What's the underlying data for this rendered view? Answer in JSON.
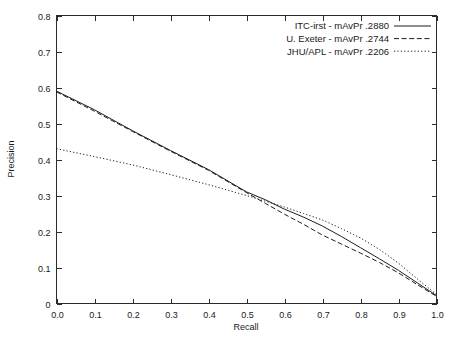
{
  "chart_data": {
    "type": "line",
    "title": "",
    "subtitle": "",
    "xlabel": "Recall",
    "ylabel": "Precision",
    "xlim": [
      0.0,
      1.0
    ],
    "ylim": [
      0.0,
      0.8
    ],
    "grid": false,
    "legend_position": "top-right",
    "x_ticks": [
      "0.0",
      "0.1",
      "0.2",
      "0.3",
      "0.4",
      "0.5",
      "0.6",
      "0.7",
      "0.8",
      "0.9",
      "1.0"
    ],
    "x_tick_values": [
      0.0,
      0.1,
      0.2,
      0.3,
      0.4,
      0.5,
      0.6,
      0.7,
      0.8,
      0.9,
      1.0
    ],
    "y_ticks": [
      "0",
      "0.1",
      "0.2",
      "0.3",
      "0.4",
      "0.5",
      "0.6",
      "0.7",
      "0.8"
    ],
    "y_tick_values": [
      0.0,
      0.1,
      0.2,
      0.3,
      0.4,
      0.5,
      0.6,
      0.7,
      0.8
    ],
    "x": [
      0.0,
      0.1,
      0.2,
      0.3,
      0.4,
      0.5,
      0.55,
      0.6,
      0.65,
      0.7,
      0.75,
      0.8,
      0.85,
      0.9,
      0.95,
      1.0
    ],
    "series": [
      {
        "name": "ITC-irst - mAvPr .2880",
        "short_name": "ITC-irst",
        "metric_label": "mAvPr",
        "metric_value": ".2880",
        "style": "solid",
        "color": "#1c1c1c",
        "values": [
          0.59,
          0.538,
          0.48,
          0.425,
          0.372,
          0.31,
          0.288,
          0.262,
          0.24,
          0.215,
          0.186,
          0.155,
          0.124,
          0.092,
          0.057,
          0.022
        ]
      },
      {
        "name": "U. Exeter - mAvPr .2744",
        "short_name": "U. Exeter",
        "metric_label": "mAvPr",
        "metric_value": ".2744",
        "style": "dashed",
        "color": "#1c1c1c",
        "values": [
          0.588,
          0.534,
          0.478,
          0.423,
          0.37,
          0.308,
          0.278,
          0.248,
          0.22,
          0.19,
          0.165,
          0.14,
          0.114,
          0.085,
          0.052,
          0.02
        ]
      },
      {
        "name": "JHU/APL - mAvPr .2206",
        "short_name": "JHU/APL",
        "metric_label": "mAvPr",
        "metric_value": ".2206",
        "style": "dotted",
        "color": "#1c1c1c",
        "values": [
          0.43,
          0.408,
          0.385,
          0.358,
          0.33,
          0.3,
          0.284,
          0.268,
          0.25,
          0.232,
          0.208,
          0.182,
          0.15,
          0.112,
          0.068,
          0.025
        ]
      }
    ]
  },
  "legend": {
    "entries": [
      {
        "label": "ITC-irst - mAvPr .2880",
        "style": "solid"
      },
      {
        "label": "U. Exeter - mAvPr .2744",
        "style": "dashed"
      },
      {
        "label": "JHU/APL - mAvPr .2206",
        "style": "dotted"
      }
    ]
  },
  "axes": {
    "x_title": "Recall",
    "y_title": "Precision"
  }
}
